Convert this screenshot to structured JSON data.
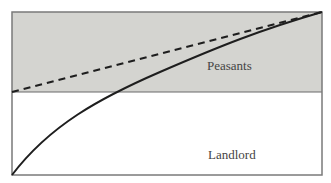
{
  "diagram": {
    "regions": {
      "upper_label": "Peasants",
      "lower_label": "Landlord"
    },
    "colors": {
      "shaded_fill": "#d4d4d0",
      "background": "#ffffff",
      "frame": "#7a7a7a",
      "curve": "#1e1e1e",
      "dashed": "#1e1e1e"
    },
    "lines": [
      {
        "name": "dashed-line",
        "style": "dashed",
        "from": [
          12,
          92
        ],
        "to": [
          322,
          12
        ]
      },
      {
        "name": "solid-curve",
        "style": "solid",
        "shape": "concave",
        "from": [
          12,
          175
        ],
        "to": [
          322,
          12
        ]
      }
    ]
  }
}
